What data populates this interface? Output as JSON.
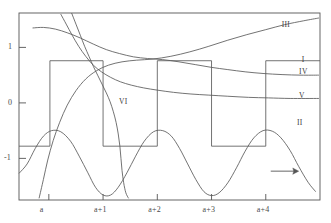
{
  "chart_data": {
    "type": "line",
    "title": "",
    "xlabel": "",
    "ylabel": "",
    "xlim": [
      -0.55,
      5.0
    ],
    "ylim": [
      -1.75,
      1.62
    ],
    "grid": false,
    "legend_position": "inline-right",
    "x_ticks": [
      {
        "value": 0,
        "label": "a"
      },
      {
        "value": 1,
        "label": "a+1"
      },
      {
        "value": 2,
        "label": "a+2"
      },
      {
        "value": 3,
        "label": "a+3"
      },
      {
        "value": 4,
        "label": "a+4"
      }
    ],
    "y_ticks": [
      {
        "value": 1,
        "label": "1"
      },
      {
        "value": 0,
        "label": "0"
      },
      {
        "value": -1,
        "label": "-1"
      }
    ],
    "annotations": [
      {
        "name": "direction-arrow",
        "symbol": "→",
        "x": 4.35,
        "y": -1.23
      }
    ],
    "series": [
      {
        "name": "I",
        "label": "I",
        "label_x": 4.72,
        "label_y": 0.78,
        "description": "square wave, period 2, amplitude 0.76 high / -0.78 low",
        "points": [
          [
            -0.55,
            -0.78
          ],
          [
            0.02,
            -0.78
          ],
          [
            0.02,
            0.76
          ],
          [
            1.0,
            0.76
          ],
          [
            1.0,
            -0.78
          ],
          [
            2.0,
            -0.78
          ],
          [
            2.0,
            0.76
          ],
          [
            3.0,
            0.76
          ],
          [
            3.0,
            -0.78
          ],
          [
            4.0,
            -0.78
          ],
          [
            4.0,
            0.76
          ],
          [
            5.0,
            0.76
          ]
        ]
      },
      {
        "name": "II",
        "label": "II",
        "label_x": 4.63,
        "label_y": -0.37,
        "description": "sinusoid, amplitude 0.62, offset -1.09, period 1.55",
        "points": [
          [
            -0.55,
            -1.27
          ],
          [
            -0.4,
            -1.1
          ],
          [
            -0.25,
            -0.82
          ],
          [
            -0.1,
            -0.6
          ],
          [
            0.05,
            -0.5
          ],
          [
            0.22,
            -0.52
          ],
          [
            0.4,
            -0.69
          ],
          [
            0.56,
            -0.96
          ],
          [
            0.72,
            -1.26
          ],
          [
            0.86,
            -1.52
          ],
          [
            1.0,
            -1.66
          ],
          [
            1.14,
            -1.66
          ],
          [
            1.28,
            -1.52
          ],
          [
            1.44,
            -1.26
          ],
          [
            1.6,
            -0.96
          ],
          [
            1.76,
            -0.69
          ],
          [
            1.93,
            -0.52
          ],
          [
            2.1,
            -0.5
          ],
          [
            2.26,
            -0.6
          ],
          [
            2.41,
            -0.82
          ],
          [
            2.56,
            -1.1
          ],
          [
            2.71,
            -1.38
          ],
          [
            2.86,
            -1.6
          ],
          [
            3.0,
            -1.67
          ],
          [
            3.14,
            -1.62
          ],
          [
            3.3,
            -1.44
          ],
          [
            3.46,
            -1.17
          ],
          [
            3.62,
            -0.87
          ],
          [
            3.78,
            -0.63
          ],
          [
            3.95,
            -0.5
          ],
          [
            4.12,
            -0.51
          ],
          [
            4.28,
            -0.63
          ],
          [
            4.45,
            -0.86
          ],
          [
            4.61,
            -1.15
          ],
          [
            4.78,
            -1.43
          ],
          [
            4.92,
            -1.6
          ]
        ]
      },
      {
        "name": "III",
        "label": "III",
        "label_x": 4.35,
        "label_y": 1.4,
        "description": "monotone increasing concave curve reaching upper right",
        "points": [
          [
            -0.18,
            -1.72
          ],
          [
            -0.1,
            -1.38
          ],
          [
            -0.02,
            -1.03
          ],
          [
            0.08,
            -0.68
          ],
          [
            0.2,
            -0.35
          ],
          [
            0.34,
            -0.04
          ],
          [
            0.5,
            0.22
          ],
          [
            0.68,
            0.43
          ],
          [
            0.88,
            0.58
          ],
          [
            1.1,
            0.68
          ],
          [
            1.35,
            0.74
          ],
          [
            1.62,
            0.77
          ],
          [
            1.92,
            0.79
          ],
          [
            2.25,
            0.84
          ],
          [
            2.6,
            0.92
          ],
          [
            2.95,
            1.02
          ],
          [
            3.3,
            1.13
          ],
          [
            3.65,
            1.23
          ],
          [
            4.0,
            1.32
          ],
          [
            4.35,
            1.41
          ],
          [
            4.7,
            1.48
          ],
          [
            4.98,
            1.53
          ]
        ]
      },
      {
        "name": "IV",
        "label": "IV",
        "label_x": 4.67,
        "label_y": 0.55,
        "description": "decaying curve from top-left settling near 0.50",
        "points": [
          [
            -0.3,
            1.35
          ],
          [
            -0.1,
            1.36
          ],
          [
            0.12,
            1.33
          ],
          [
            0.35,
            1.26
          ],
          [
            0.58,
            1.17
          ],
          [
            0.82,
            1.06
          ],
          [
            1.06,
            0.96
          ],
          [
            1.3,
            0.89
          ],
          [
            1.56,
            0.83
          ],
          [
            1.82,
            0.8
          ],
          [
            2.1,
            0.78
          ],
          [
            2.4,
            0.74
          ],
          [
            2.7,
            0.69
          ],
          [
            3.0,
            0.64
          ],
          [
            3.3,
            0.6
          ],
          [
            3.62,
            0.56
          ],
          [
            3.95,
            0.53
          ],
          [
            4.3,
            0.51
          ],
          [
            4.65,
            0.5
          ],
          [
            4.98,
            0.5
          ]
        ]
      },
      {
        "name": "V",
        "label": "V",
        "label_x": 4.67,
        "label_y": 0.12,
        "description": "steeply decaying curve flattening toward 0.08",
        "points": [
          [
            0.22,
            1.6
          ],
          [
            0.32,
            1.42
          ],
          [
            0.43,
            1.22
          ],
          [
            0.55,
            1.02
          ],
          [
            0.68,
            0.84
          ],
          [
            0.82,
            0.68
          ],
          [
            0.97,
            0.56
          ],
          [
            1.14,
            0.46
          ],
          [
            1.32,
            0.38
          ],
          [
            1.52,
            0.32
          ],
          [
            1.75,
            0.27
          ],
          [
            2.0,
            0.23
          ],
          [
            2.3,
            0.19
          ],
          [
            2.62,
            0.16
          ],
          [
            2.95,
            0.14
          ],
          [
            3.3,
            0.12
          ],
          [
            3.68,
            0.1
          ],
          [
            4.05,
            0.09
          ],
          [
            4.45,
            0.08
          ],
          [
            4.98,
            0.08
          ]
        ]
      },
      {
        "name": "VI",
        "label": "VI",
        "label_x": 1.35,
        "label_y": 0.02,
        "description": "steep S-curve descending from top then bending down to low right",
        "points": [
          [
            0.42,
            1.62
          ],
          [
            0.5,
            1.42
          ],
          [
            0.58,
            1.22
          ],
          [
            0.66,
            1.02
          ],
          [
            0.74,
            0.84
          ],
          [
            0.82,
            0.66
          ],
          [
            0.9,
            0.5
          ],
          [
            0.98,
            0.34
          ],
          [
            1.06,
            0.18
          ],
          [
            1.13,
            0.02
          ],
          [
            1.19,
            -0.16
          ],
          [
            1.24,
            -0.35
          ],
          [
            1.28,
            -0.56
          ],
          [
            1.31,
            -0.78
          ],
          [
            1.33,
            -1.0
          ],
          [
            1.35,
            -1.22
          ],
          [
            1.38,
            -1.44
          ],
          [
            1.42,
            -1.62
          ],
          [
            1.47,
            -1.72
          ]
        ]
      }
    ]
  }
}
